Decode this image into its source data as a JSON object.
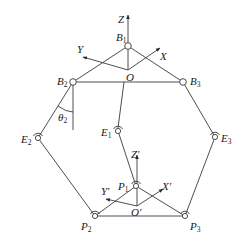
{
  "diagram": {
    "type": "delta-robot-kinematic-schematic",
    "base_frame": {
      "origin": "O",
      "axes": [
        "X",
        "Y",
        "Z"
      ]
    },
    "moving_frame": {
      "origin": "O'",
      "axes": [
        "X'",
        "Y'",
        "Z'"
      ]
    },
    "angle": {
      "symbol": "θ",
      "sub": "2"
    },
    "joints": [
      {
        "id": "B1",
        "base": "B",
        "sub": "1",
        "x": 128,
        "y": 46
      },
      {
        "id": "B2",
        "base": "B",
        "sub": "2",
        "x": 73,
        "y": 82
      },
      {
        "id": "B3",
        "base": "B",
        "sub": "3",
        "x": 183,
        "y": 82
      },
      {
        "id": "E1",
        "base": "E",
        "sub": "1",
        "x": 118,
        "y": 131
      },
      {
        "id": "E2",
        "base": "E",
        "sub": "2",
        "x": 38,
        "y": 138
      },
      {
        "id": "E3",
        "base": "E",
        "sub": "3",
        "x": 215,
        "y": 137
      },
      {
        "id": "P1",
        "base": "P",
        "sub": "1",
        "x": 136,
        "y": 186
      },
      {
        "id": "P2",
        "base": "P",
        "sub": "2",
        "x": 95,
        "y": 216
      },
      {
        "id": "P3",
        "base": "P",
        "sub": "3",
        "x": 185,
        "y": 216
      }
    ],
    "labels": {
      "Z": "Z",
      "Y": "Y",
      "X": "X",
      "O": "O",
      "Zp": "Z'",
      "Yp": "Y'",
      "Xp": "X'",
      "Op": "O'",
      "B": "B",
      "E": "E",
      "P": "P",
      "theta": "θ",
      "s1": "1",
      "s2": "2",
      "s3": "3"
    },
    "colors": {
      "line": "#3a3a3a",
      "text": "#1a1a1a",
      "background": "#ffffff"
    }
  }
}
